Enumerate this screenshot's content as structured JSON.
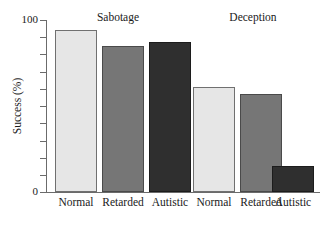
{
  "chart_data": {
    "type": "bar",
    "title": "",
    "subtitle": "",
    "xlabel": "",
    "ylabel": "Success (%)",
    "ylim": [
      0,
      100
    ],
    "y_ticks": [
      0,
      10,
      20,
      30,
      40,
      50,
      60,
      70,
      80,
      90,
      100
    ],
    "y_tick_labels_shown": [
      "0",
      "100"
    ],
    "grid": false,
    "legend": false,
    "groups": [
      {
        "name": "Sabotage",
        "categories": [
          "Normal",
          "Retarded",
          "Autistic"
        ],
        "values": [
          94,
          85,
          87
        ],
        "shades": [
          "light",
          "medium",
          "dark"
        ]
      },
      {
        "name": "Deception",
        "categories": [
          "Normal",
          "Retarded",
          "Autistic"
        ],
        "values": [
          61,
          57,
          15
        ],
        "shades": [
          "light",
          "medium",
          "dark"
        ]
      }
    ],
    "categories": [
      "Normal",
      "Retarded",
      "Autistic"
    ],
    "series": [
      {
        "name": "Sabotage",
        "values": [
          94,
          85,
          87
        ]
      },
      {
        "name": "Deception",
        "values": [
          61,
          57,
          15
        ]
      }
    ],
    "colors": {
      "light": "#e6e6e6",
      "medium": "#767676",
      "dark": "#2f2f2f",
      "axis": "#6b6b6b",
      "text": "#1a1a1a",
      "background": "#ffffff"
    }
  },
  "axis": {
    "y_top_label": "100",
    "y_bottom_label": "0",
    "y_title": "Success (%)"
  },
  "groups": {
    "0": {
      "title": "Sabotage"
    },
    "1": {
      "title": "Deception"
    }
  },
  "labels": {
    "g0c0": "Normal",
    "g0c1": "Retarded",
    "g0c2": "Autistic",
    "g1c0": "Normal",
    "g1c1": "Retarded",
    "g1c2": "Autistic"
  }
}
